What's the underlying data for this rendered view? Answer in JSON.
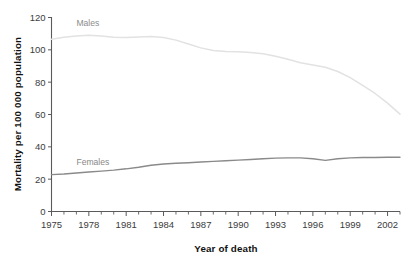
{
  "chart_data": {
    "type": "line",
    "title": "",
    "xlabel": "Year of death",
    "ylabel": "Mortality per 100 000 population",
    "xlim": [
      1975,
      2003
    ],
    "ylim": [
      0,
      120
    ],
    "grid": false,
    "legend_position": "inline-annotation",
    "x": [
      1975,
      1976,
      1977,
      1978,
      1979,
      1980,
      1981,
      1982,
      1983,
      1984,
      1985,
      1986,
      1987,
      1988,
      1989,
      1990,
      1991,
      1992,
      1993,
      1994,
      1995,
      1996,
      1997,
      1998,
      1999,
      2000,
      2001,
      2002,
      2003
    ],
    "xtick_labels": [
      "1975",
      "1978",
      "1981",
      "1984",
      "1987",
      "1990",
      "1993",
      "1996",
      "1999",
      "2002"
    ],
    "xtick_values": [
      1975,
      1978,
      1981,
      1984,
      1987,
      1990,
      1993,
      1996,
      1999,
      2002
    ],
    "ytick_labels": [
      "0",
      "20",
      "40",
      "60",
      "80",
      "100",
      "120"
    ],
    "ytick_values": [
      0,
      20,
      40,
      60,
      80,
      100,
      120
    ],
    "series": [
      {
        "name": "Males",
        "color": "#e2e2e2",
        "label_x": 1977,
        "label_y": 115,
        "values": [
          106.5,
          107.8,
          108.6,
          109.0,
          108.6,
          107.8,
          107.6,
          108.0,
          108.2,
          107.6,
          106.0,
          103.6,
          101.2,
          99.6,
          99.0,
          98.8,
          98.4,
          97.6,
          96.0,
          94.2,
          92.0,
          90.6,
          89.2,
          86.6,
          82.8,
          78.0,
          73.0,
          67.0,
          60.2
        ]
      },
      {
        "name": "Females",
        "color": "#8a8a8a",
        "label_x": 1977,
        "label_y": 29,
        "values": [
          22.8,
          23.2,
          23.8,
          24.4,
          25.0,
          25.6,
          26.4,
          27.4,
          28.6,
          29.4,
          29.8,
          30.2,
          30.6,
          31.0,
          31.4,
          31.8,
          32.2,
          32.6,
          33.0,
          33.2,
          33.2,
          32.6,
          31.6,
          32.6,
          33.2,
          33.4,
          33.4,
          33.6,
          33.6
        ]
      }
    ]
  },
  "annotations": {
    "males_label": "Males",
    "females_label": "Females"
  }
}
